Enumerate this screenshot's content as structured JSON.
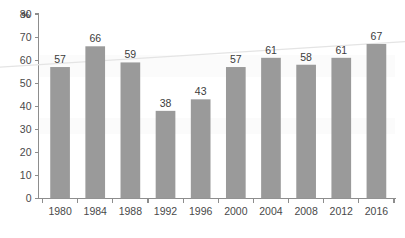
{
  "chart_data": {
    "type": "bar",
    "title": "",
    "subtitle": "",
    "xlabel": "",
    "ylabel": "%",
    "unit_label": "%",
    "categories": [
      "1980",
      "1984",
      "1988",
      "1992",
      "1996",
      "2000",
      "2004",
      "2008",
      "2012",
      "2016"
    ],
    "values": [
      57,
      66,
      59,
      38,
      43,
      57,
      61,
      58,
      61,
      67
    ],
    "ylim": [
      0,
      80
    ],
    "ytick_step": 10,
    "ytick_labels": [
      "0",
      "10",
      "20",
      "30",
      "40",
      "50",
      "60",
      "70",
      "80"
    ],
    "grid": false,
    "legend": null,
    "bar_color": "#9a9a9a",
    "axis_color": "#8d8d8d",
    "label_color": "#3c3c3c",
    "background_color": "#ffffff",
    "series": [
      {
        "name": "Value",
        "values": [
          57,
          66,
          59,
          38,
          43,
          57,
          61,
          58,
          61,
          67
        ]
      }
    ],
    "annotations": {
      "trend_line": {
        "type": "line",
        "color": "#e4e4e4",
        "start_value": 57,
        "end_value": 68,
        "note": "faint light-gray rising trend line across plot"
      }
    },
    "data_labels": [
      "57",
      "66",
      "59",
      "38",
      "43",
      "57",
      "61",
      "58",
      "61",
      "67"
    ]
  }
}
